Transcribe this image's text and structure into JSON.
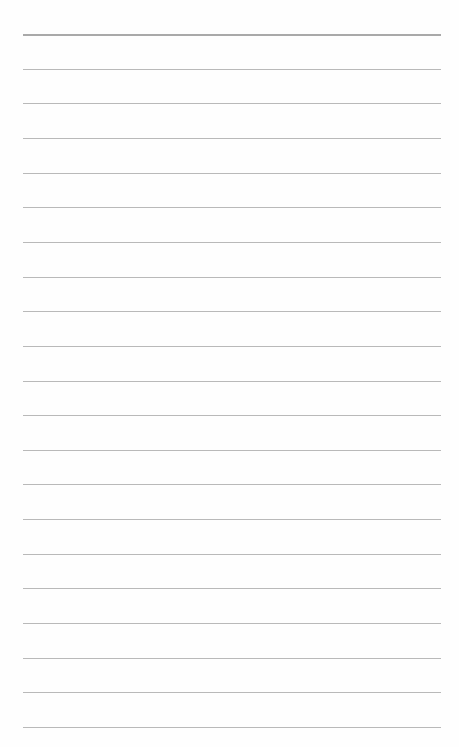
{
  "page": {
    "type": "ruled-notebook-page",
    "background_color": "#fefefe",
    "rule_color": "#b9b9b9",
    "rule_count": 21,
    "rule_start_y": 34,
    "rule_spacing": 34.65,
    "rule_left_x": 23,
    "rule_right_x": 441,
    "text": ""
  }
}
